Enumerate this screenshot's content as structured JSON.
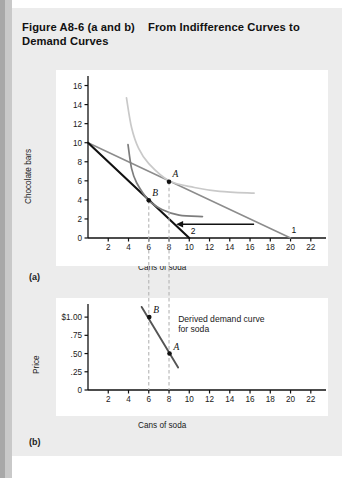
{
  "figure": {
    "title_main": "Figure A8-6 (a and b)",
    "title_sub": "From Indifference Curves to Demand Curves",
    "panel_a_label": "(a)",
    "panel_b_label": "(b)"
  },
  "chart_data": [
    {
      "type": "line",
      "panel": "(a)",
      "title": "Indifference curves and budget lines",
      "xlabel": "Cans of soda",
      "ylabel": "Chocolate bars",
      "xlim": [
        0,
        23.5
      ],
      "ylim": [
        0,
        17
      ],
      "xticks": [
        2,
        4,
        6,
        8,
        10,
        12,
        14,
        16,
        18,
        20,
        22
      ],
      "yticks": [
        0,
        2,
        4,
        6,
        8,
        10,
        12,
        14,
        16
      ],
      "grid": false,
      "legend": "none",
      "series": [
        {
          "name": "Budget line 1",
          "label": "1",
          "color": "#8c8c8c",
          "style": "straight",
          "points": [
            [
              0,
              10
            ],
            [
              20,
              0
            ]
          ]
        },
        {
          "name": "Budget line 2",
          "label": "2",
          "color": "#111111",
          "style": "straight",
          "points": [
            [
              0,
              10
            ],
            [
              10,
              0
            ]
          ]
        },
        {
          "name": "Indifference curve high",
          "color": "#c9c9c9",
          "style": "curve",
          "points": [
            [
              3.8,
              14.7
            ],
            [
              4.3,
              11.6
            ],
            [
              5.0,
              9.4
            ],
            [
              6.0,
              7.8
            ],
            [
              8.0,
              6.0
            ],
            [
              10.5,
              5.3
            ],
            [
              13.0,
              4.9
            ],
            [
              16.4,
              4.7
            ]
          ]
        },
        {
          "name": "Indifference curve low",
          "color": "#7d7d7d",
          "style": "curve",
          "points": [
            [
              3.95,
              9.8
            ],
            [
              4.3,
              7.3
            ],
            [
              4.8,
              5.8
            ],
            [
              6.0,
              3.95
            ],
            [
              7.3,
              3.0
            ],
            [
              9.0,
              2.4
            ],
            [
              11.3,
              2.25
            ]
          ]
        }
      ],
      "points": [
        {
          "label": "A",
          "x": 8,
          "y": 5.9
        },
        {
          "label": "B",
          "x": 6,
          "y": 3.95
        }
      ],
      "guides": [
        {
          "x": 6,
          "from_y": 3.95,
          "to_y": 0
        },
        {
          "x": 8,
          "from_y": 5.9,
          "to_y": 0
        }
      ],
      "arrow": {
        "from_x": 16.4,
        "to_x": 8.7,
        "y": 1.45,
        "color": "#111111"
      }
    },
    {
      "type": "line",
      "panel": "(b)",
      "title": "Derived demand curve",
      "xlabel": "Cans of soda",
      "ylabel": "Price",
      "xlim": [
        0,
        23.5
      ],
      "ylim": [
        0,
        1.18
      ],
      "xticks": [
        2,
        4,
        6,
        8,
        10,
        12,
        14,
        16,
        18,
        20,
        22
      ],
      "yticks": [
        0,
        0.25,
        0.5,
        0.75,
        1.0
      ],
      "ytick_labels": [
        "0",
        ".25",
        ".50",
        ".75",
        "$1.00"
      ],
      "grid": false,
      "legend": "none",
      "annotation": "Derived demand curve\nfor soda",
      "series": [
        {
          "name": "Demand curve",
          "color": "#555555",
          "style": "straight",
          "points": [
            [
              5.3,
              1.14
            ],
            [
              8.9,
              0.31
            ]
          ]
        }
      ],
      "points": [
        {
          "label": "B",
          "x": 6.05,
          "y": 1.0
        },
        {
          "label": "A",
          "x": 8.05,
          "y": 0.5
        }
      ],
      "guides": [
        {
          "x": 6,
          "from_y": 1.18,
          "to_y": 0
        },
        {
          "x": 8,
          "from_y": 1.18,
          "to_y": 0
        }
      ]
    }
  ],
  "labels": {
    "annotation_line1": "Derived demand curve",
    "annotation_line2": "for soda",
    "point_a": "A",
    "point_b": "B",
    "budget1": "1",
    "budget2": "2"
  },
  "colors": {
    "background": "#ececec",
    "plot_background": "#ffffff",
    "axis": "#111111",
    "budget_line_1": "#8c8c8c",
    "budget_line_2": "#111111",
    "indifference_high": "#c9c9c9",
    "indifference_low": "#7d7d7d",
    "demand_curve": "#555555",
    "guide_line": "#b4b4b4"
  }
}
